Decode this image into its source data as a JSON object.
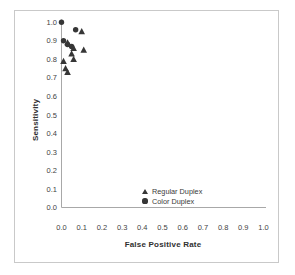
{
  "figure": {
    "background": "#ffffff",
    "border_color": "#c9c9c9",
    "axis_color": "#a8a8a8",
    "text_color": "#3f3f3f",
    "marker_color": "#363636"
  },
  "chart_data": {
    "type": "scatter",
    "title": "",
    "xlabel": "False Positive Rate",
    "ylabel": "Sensitivity",
    "xlim": [
      0.0,
      1.0
    ],
    "ylim": [
      0.0,
      1.0
    ],
    "grid": false,
    "legend_position": "inside bottom-center",
    "x_tick_labels": [
      "0.0",
      "0.1",
      "0.2",
      "0.3",
      "0.4",
      "0.5",
      "0.6",
      "0.7",
      "0.8",
      "0.9",
      "1.0"
    ],
    "y_tick_labels": [
      "0.0",
      "0.1",
      "0.2",
      "0.3",
      "0.4",
      "0.5",
      "0.6",
      "0.7",
      "0.8",
      "0.9",
      "1.0"
    ],
    "series": [
      {
        "name": "Regular Duplex",
        "marker": "triangle",
        "color": "#363636",
        "points": [
          [
            0.1,
            0.95
          ],
          [
            0.03,
            0.89
          ],
          [
            0.06,
            0.86
          ],
          [
            0.11,
            0.85
          ],
          [
            0.05,
            0.83
          ],
          [
            0.06,
            0.8
          ],
          [
            0.01,
            0.79
          ],
          [
            0.02,
            0.75
          ],
          [
            0.03,
            0.73
          ]
        ]
      },
      {
        "name": "Color Duplex",
        "marker": "circle",
        "color": "#363636",
        "points": [
          [
            0.0,
            1.0
          ],
          [
            0.07,
            0.96
          ],
          [
            0.01,
            0.9
          ],
          [
            0.03,
            0.88
          ],
          [
            0.05,
            0.87
          ]
        ]
      }
    ]
  }
}
